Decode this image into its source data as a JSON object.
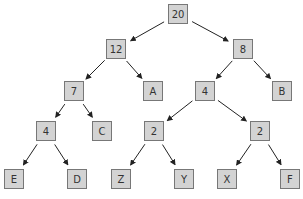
{
  "diagram": {
    "type": "huffman-tree",
    "colors": {
      "node_fill": "#d3d3d3",
      "node_border": "#777777",
      "edge": "#222222",
      "text": "#333333"
    },
    "nodes": [
      {
        "id": "n20",
        "label": "20",
        "x": 168,
        "y": 4
      },
      {
        "id": "n12",
        "label": "12",
        "x": 106,
        "y": 39
      },
      {
        "id": "n8",
        "label": "8",
        "x": 233,
        "y": 39
      },
      {
        "id": "n7",
        "label": "7",
        "x": 64,
        "y": 81
      },
      {
        "id": "nA",
        "label": "A",
        "x": 143,
        "y": 81
      },
      {
        "id": "n4a",
        "label": "4",
        "x": 195,
        "y": 81
      },
      {
        "id": "nB",
        "label": "B",
        "x": 272,
        "y": 81
      },
      {
        "id": "n4b",
        "label": "4",
        "x": 36,
        "y": 121
      },
      {
        "id": "nC",
        "label": "C",
        "x": 92,
        "y": 121
      },
      {
        "id": "n2a",
        "label": "2",
        "x": 144,
        "y": 121
      },
      {
        "id": "n2b",
        "label": "2",
        "x": 250,
        "y": 121
      },
      {
        "id": "nE",
        "label": "E",
        "x": 4,
        "y": 169
      },
      {
        "id": "nD",
        "label": "D",
        "x": 67,
        "y": 169
      },
      {
        "id": "nZ",
        "label": "Z",
        "x": 111,
        "y": 169
      },
      {
        "id": "nY",
        "label": "Y",
        "x": 174,
        "y": 169
      },
      {
        "id": "nX",
        "label": "X",
        "x": 217,
        "y": 169
      },
      {
        "id": "nF",
        "label": "F",
        "x": 280,
        "y": 169
      }
    ],
    "edges": [
      [
        "n20",
        "n12"
      ],
      [
        "n20",
        "n8"
      ],
      [
        "n12",
        "n7"
      ],
      [
        "n12",
        "nA"
      ],
      [
        "n8",
        "n4a"
      ],
      [
        "n8",
        "nB"
      ],
      [
        "n7",
        "n4b"
      ],
      [
        "n7",
        "nC"
      ],
      [
        "n4a",
        "n2a"
      ],
      [
        "n4a",
        "n2b"
      ],
      [
        "n4b",
        "nE"
      ],
      [
        "n4b",
        "nD"
      ],
      [
        "n2a",
        "nZ"
      ],
      [
        "n2a",
        "nY"
      ],
      [
        "n2b",
        "nX"
      ],
      [
        "n2b",
        "nF"
      ]
    ]
  }
}
